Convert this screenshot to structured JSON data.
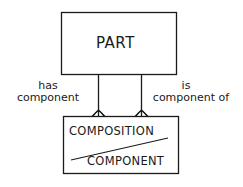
{
  "diagram": {
    "type": "entity-relationship",
    "entities": [
      {
        "id": "part",
        "label": "PART"
      },
      {
        "id": "composition",
        "label_top": "COMPOSITION",
        "label_bottom": "COMPONENT"
      }
    ],
    "relationships": [
      {
        "from": "part",
        "to": "composition",
        "label_line1": "has",
        "label_line2": "component",
        "cardinality_end": "many"
      },
      {
        "from": "part",
        "to": "composition",
        "label_line1": "is",
        "label_line2": "component of",
        "cardinality_end": "many"
      }
    ],
    "colors": {
      "stroke": "#1a1a1a",
      "background": "#ffffff"
    }
  }
}
